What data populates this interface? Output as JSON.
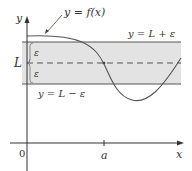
{
  "diagram": {
    "labels": {
      "y_axis": "y",
      "x_axis": "x",
      "origin": "0",
      "a_tick": "a",
      "L_label": "L",
      "epsilon_upper": "ε",
      "epsilon_lower": "ε",
      "curve_label": "y = f(x)",
      "upper_line_label": "y = L + ε",
      "lower_line_label": "y = L − ε"
    },
    "colors": {
      "band_fill": "#e3e3e3",
      "band_edge": "#555555",
      "curve": "#555555",
      "axis": "#333333",
      "dashed_line": "#555555"
    }
  }
}
